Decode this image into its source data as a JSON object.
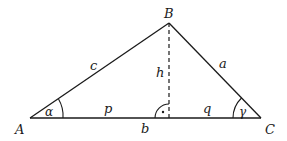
{
  "diagram": {
    "type": "triangle-with-altitude",
    "colors": {
      "stroke": "#1a1a1a",
      "background": "#ffffff"
    },
    "vertices": {
      "A": {
        "label": "A"
      },
      "B": {
        "label": "B"
      },
      "C": {
        "label": "C"
      }
    },
    "sides": {
      "a": {
        "label": "a"
      },
      "b": {
        "label": "b"
      },
      "c": {
        "label": "c"
      }
    },
    "altitude": {
      "label": "h",
      "style": "dashed"
    },
    "segments": {
      "p": {
        "label": "p"
      },
      "q": {
        "label": "q"
      }
    },
    "angles": {
      "alpha": {
        "label": "α"
      },
      "gamma": {
        "label": "γ"
      }
    },
    "right_angle_marker": {
      "label": "·"
    }
  }
}
